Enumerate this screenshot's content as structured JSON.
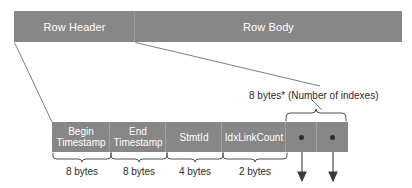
{
  "diagram": {
    "colors": {
      "bar_fill": "#878787",
      "bar_text": "#ffffff",
      "caption_text": "#2b2b2b",
      "line": "#6f6f6f",
      "dot": "#2f2f2f",
      "background": "#ffffff"
    },
    "row_bar": {
      "segments": [
        {
          "id": "row-header",
          "label": "Row Header"
        },
        {
          "id": "row-body",
          "label": "Row Body"
        }
      ]
    },
    "field_bar": {
      "cells": [
        {
          "id": "begin-timestamp",
          "line1": "Begin",
          "line2": "Timestamp",
          "size": "8 bytes"
        },
        {
          "id": "end-timestamp",
          "line1": "End",
          "line2": "Timestamp",
          "size": "8 bytes"
        },
        {
          "id": "stmtid",
          "line1": "StmtId",
          "line2": "",
          "size": "4 bytes"
        },
        {
          "id": "idxlinkcount",
          "line1": "IdxLinkCount",
          "line2": "",
          "size": "2 bytes"
        },
        {
          "id": "index-link-1",
          "line1": "",
          "line2": "",
          "size": ""
        },
        {
          "id": "index-link-2",
          "line1": "",
          "line2": "",
          "size": ""
        }
      ]
    },
    "annotations": {
      "index_note": "8 bytes* (Number of indexes)"
    }
  }
}
